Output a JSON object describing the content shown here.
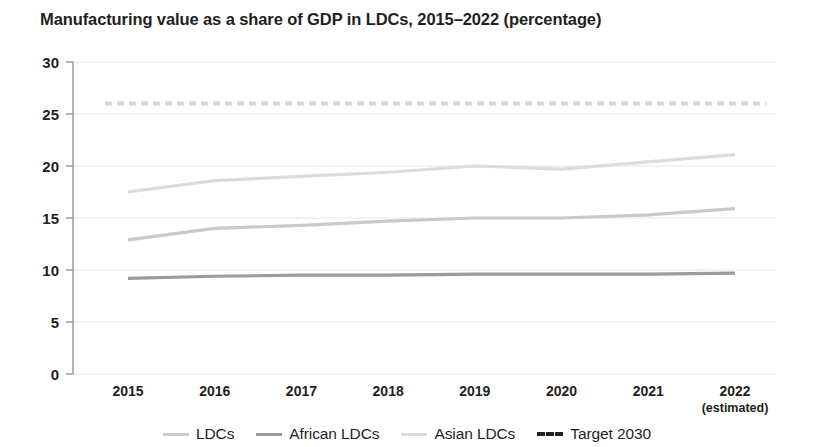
{
  "chart_data": {
    "type": "line",
    "title": "Manufacturing value as a share of GDP in LDCs, 2015–2022 (percentage)",
    "xlabel": "",
    "ylabel": "",
    "categories": [
      "2015",
      "2016",
      "2017",
      "2018",
      "2019",
      "2020",
      "2021",
      "2022"
    ],
    "x_sublabels": [
      "",
      "",
      "",
      "",
      "",
      "",
      "",
      "(estimated)"
    ],
    "ylim": [
      0,
      30
    ],
    "yticks": [
      0,
      5,
      10,
      15,
      20,
      25,
      30
    ],
    "grid": "horizontal",
    "legend_position": "bottom",
    "series": [
      {
        "name": "LDCs",
        "color": "#c9c9c9",
        "style": "solid",
        "values": [
          12.9,
          14.0,
          14.3,
          14.7,
          15.0,
          15.0,
          15.3,
          15.9
        ]
      },
      {
        "name": "African LDCs",
        "color": "#9b9b9b",
        "style": "solid",
        "values": [
          9.2,
          9.4,
          9.5,
          9.5,
          9.6,
          9.6,
          9.6,
          9.7
        ]
      },
      {
        "name": "Asian LDCs",
        "color": "#dcdcdc",
        "style": "solid",
        "values": [
          17.5,
          18.6,
          19.0,
          19.4,
          20.0,
          19.7,
          20.4,
          21.1
        ]
      },
      {
        "name": "Target 2030",
        "color": "#d6d6d6",
        "style": "dashed",
        "values": [
          26.0,
          26.0,
          26.0,
          26.0,
          26.0,
          26.0,
          26.0,
          26.0
        ]
      }
    ]
  },
  "legend": {
    "items": [
      {
        "label": "LDCs",
        "color": "#c9c9c9",
        "style": "solid"
      },
      {
        "label": "African LDCs",
        "color": "#9b9b9b",
        "style": "solid"
      },
      {
        "label": "Asian LDCs",
        "color": "#dcdcdc",
        "style": "solid"
      },
      {
        "label": "Target 2030",
        "color": "#231f20",
        "style": "dashed"
      }
    ]
  },
  "axis": {
    "grid_color": "#e6e6e6",
    "axis_color": "#8d8d8d"
  }
}
